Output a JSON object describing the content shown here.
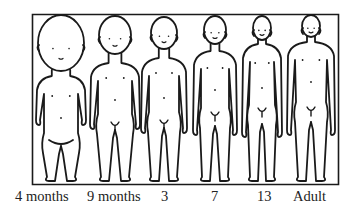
{
  "figure": {
    "stroke_color": "#1a1a1a",
    "background": "#ffffff",
    "stages": [
      {
        "id": "4-months",
        "label": "4 months",
        "head_ratio": 0.38
      },
      {
        "id": "9-months",
        "label": "9 months",
        "head_ratio": 0.28
      },
      {
        "id": "3",
        "label": "3",
        "head_ratio": 0.24
      },
      {
        "id": "7",
        "label": "7",
        "head_ratio": 0.2
      },
      {
        "id": "13",
        "label": "13",
        "head_ratio": 0.18
      },
      {
        "id": "adult",
        "label": "Adult",
        "head_ratio": 0.16
      }
    ]
  }
}
